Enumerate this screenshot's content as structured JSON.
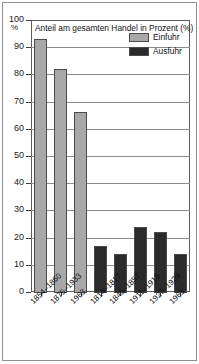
{
  "chart_data": {
    "type": "bar",
    "title": "Anteil am gesamten Handel in Prozent (%)",
    "xlabel": "",
    "ylabel": "%",
    "ylim": [
      0,
      100
    ],
    "ytick_step": 10,
    "grid": true,
    "legend_position": "top-right",
    "categories": [
      "1854–1860",
      "1875–1933",
      "1963",
      "1814–1817",
      "1845–1857",
      "1911–1913",
      "1927–1929",
      "1963"
    ],
    "series": [
      {
        "name": "Einfuhr",
        "color": "#a8a8a8",
        "values": [
          93,
          82,
          66,
          null,
          null,
          null,
          null,
          null
        ]
      },
      {
        "name": "Ausfuhr",
        "color": "#2b2b2b",
        "values": [
          null,
          null,
          null,
          17,
          14,
          24,
          22,
          14
        ]
      }
    ],
    "ytick_labels": [
      "100",
      "90",
      "80",
      "70",
      "60",
      "50",
      "40",
      "30",
      "20",
      "10",
      "0"
    ],
    "bars": [
      {
        "label": "1854–1860",
        "value": 93,
        "series": "Einfuhr"
      },
      {
        "label": "1875–1933",
        "value": 82,
        "series": "Einfuhr"
      },
      {
        "label": "1963",
        "value": 66,
        "series": "Einfuhr"
      },
      {
        "label": "1814–1817",
        "value": 17,
        "series": "Ausfuhr"
      },
      {
        "label": "1845–1857",
        "value": 14,
        "series": "Ausfuhr"
      },
      {
        "label": "1911–1913",
        "value": 24,
        "series": "Ausfuhr"
      },
      {
        "label": "1927–1929",
        "value": 22,
        "series": "Ausfuhr"
      },
      {
        "label": "1963",
        "value": 14,
        "series": "Ausfuhr"
      }
    ]
  },
  "legend": {
    "items": [
      {
        "label": "Einfuhr",
        "color": "#a8a8a8"
      },
      {
        "label": "Ausfuhr",
        "color": "#2b2b2b"
      }
    ]
  },
  "axis": {
    "percent_sign": "%",
    "y_labels": [
      "100",
      "90",
      "80",
      "70",
      "60",
      "50",
      "40",
      "30",
      "20",
      "10",
      "0"
    ]
  },
  "colors": {
    "einfuhr": "#a8a8a8",
    "ausfuhr": "#2b2b2b",
    "grid": "#8d8d8d",
    "frame": "#5d5d5d",
    "outer_border": "#8f8f8f",
    "text": "#111111"
  }
}
